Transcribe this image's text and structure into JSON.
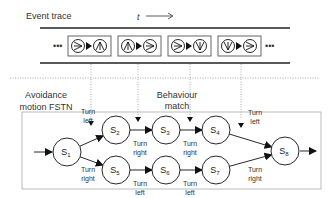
{
  "trace": {
    "title": "Event trace",
    "time_label": "t",
    "ellipsis_left": "•••",
    "ellipsis_right": "•••",
    "events": [
      {
        "from": "right",
        "to": "up"
      },
      {
        "from": "up",
        "to": "right"
      },
      {
        "from": "right",
        "to": "down"
      },
      {
        "from": "down",
        "to": "right"
      }
    ]
  },
  "fstn": {
    "title_line1": "Avoidance",
    "title_line2": "motion FSTN",
    "match_line1": "Behaviour",
    "match_line2": "match",
    "states": [
      {
        "id": "S",
        "sub": "1"
      },
      {
        "id": "S",
        "sub": "2"
      },
      {
        "id": "S",
        "sub": "3"
      },
      {
        "id": "S",
        "sub": "4"
      },
      {
        "id": "S",
        "sub": "5"
      },
      {
        "id": "S",
        "sub": "6"
      },
      {
        "id": "S",
        "sub": "7"
      },
      {
        "id": "S",
        "sub": "8"
      }
    ],
    "transitions": [
      {
        "from": "S1",
        "to": "S2",
        "l1": "Turn",
        "l2": "left"
      },
      {
        "from": "S1",
        "to": "S5",
        "l1": "Turn",
        "l2": "right"
      },
      {
        "from": "S2",
        "to": "S3",
        "l1": "Turn",
        "l2": "right"
      },
      {
        "from": "S3",
        "to": "S4",
        "l1": "Turn",
        "l2": "right"
      },
      {
        "from": "S4",
        "to": "S8",
        "l1": "Turn",
        "l2": "left"
      },
      {
        "from": "S5",
        "to": "S6",
        "l1": "Turn",
        "l2": "left"
      },
      {
        "from": "S6",
        "to": "S7",
        "l1": "Turn",
        "l2": "left"
      },
      {
        "from": "S7",
        "to": "S8",
        "l1": "Turn",
        "l2": "right"
      }
    ]
  }
}
